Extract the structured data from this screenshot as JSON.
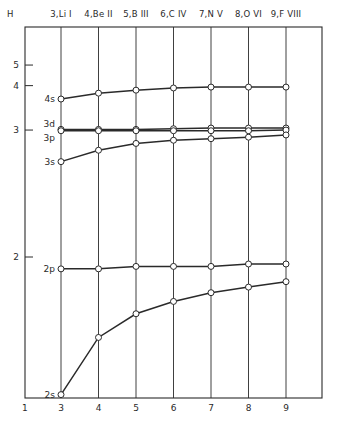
{
  "chart_data": {
    "type": "line",
    "title": "",
    "xlabel": "",
    "ylabel": "",
    "y_scale": "effective quantum number (plotted linear in 1/n²)",
    "corner_top_left": "H",
    "corner_bottom_left": "1",
    "x": [
      3,
      4,
      5,
      6,
      7,
      8,
      9
    ],
    "x_tick_labels": [
      "3",
      "4",
      "5",
      "6",
      "7",
      "8",
      "9"
    ],
    "top_labels": [
      "3,Li I",
      "4,Be II",
      "5,B III",
      "6,C IV",
      "7,N V",
      "8,O VI",
      "9,F VIII"
    ],
    "y_ticks": [
      2,
      3,
      4,
      5
    ],
    "y_tick_labels": [
      "2",
      "3",
      "4",
      "5"
    ],
    "grid": "vertical lines at each x",
    "legend": "none (inline series labels at left)",
    "series": [
      {
        "name": "4s",
        "values": [
          3.6,
          3.76,
          3.85,
          3.92,
          3.95,
          3.95,
          3.95
        ]
      },
      {
        "name": "3d",
        "values": [
          3.01,
          3.01,
          3.01,
          3.02,
          3.03,
          3.03,
          3.03
        ]
      },
      {
        "name": "3p",
        "values": [
          2.99,
          2.99,
          2.99,
          2.99,
          2.99,
          2.99,
          3.0
        ]
      },
      {
        "name": "3s",
        "values": [
          2.62,
          2.74,
          2.82,
          2.86,
          2.88,
          2.9,
          2.93
        ]
      },
      {
        "name": "2p",
        "values": [
          1.95,
          1.95,
          1.96,
          1.96,
          1.96,
          1.97,
          1.97
        ]
      },
      {
        "name": "2s",
        "values": [
          1.58,
          1.72,
          1.79,
          1.83,
          1.86,
          1.88,
          1.9
        ]
      }
    ]
  }
}
